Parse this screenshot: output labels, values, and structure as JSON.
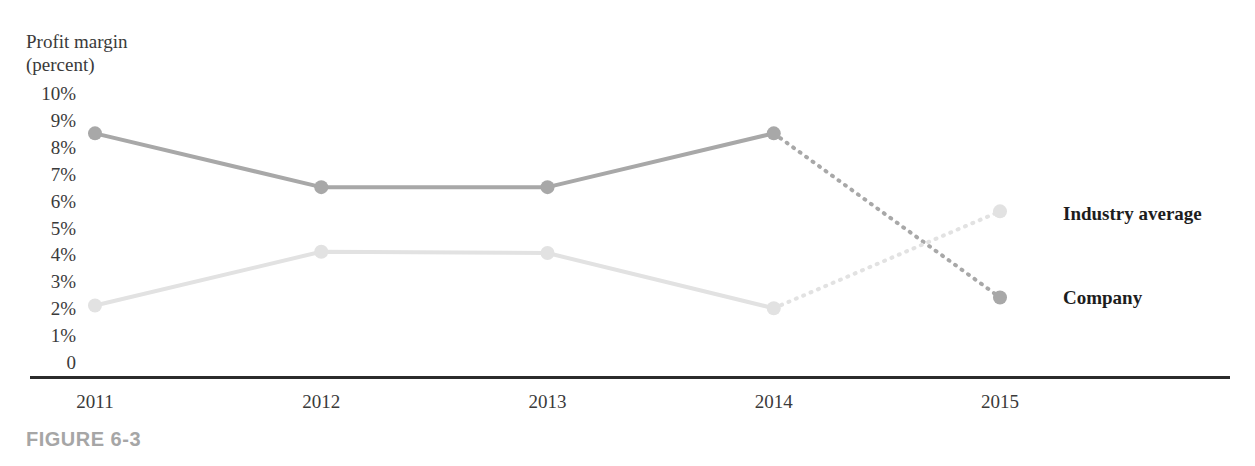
{
  "figure": {
    "caption": "FIGURE 6-3"
  },
  "axis": {
    "y_title_line1": "Profit margin",
    "y_title_line2": "(percent)",
    "y_ticks": [
      "10%",
      "9%",
      "8%",
      "7%",
      "6%",
      "5%",
      "4%",
      "3%",
      "2%",
      "1%",
      "0"
    ],
    "x_ticks": [
      "2011",
      "2012",
      "2013",
      "2014",
      "2015"
    ]
  },
  "legend": {
    "industry_label": "Industry average",
    "company_label": "Company"
  },
  "colors": {
    "industry_line": "#a8a8a8",
    "company_line": "#e2e2e2",
    "axis_rule": "#2b2b2b",
    "text": "#3a3a3a",
    "legend_text": "#1d1d1d",
    "caption_text": "#a6a6a6",
    "background": "#ffffff"
  },
  "chart_data": {
    "type": "line",
    "title": "",
    "xlabel": "",
    "ylabel": "Profit margin (percent)",
    "x": [
      "2011",
      "2012",
      "2013",
      "2014",
      "2015"
    ],
    "ylim": [
      0,
      10
    ],
    "ytick_values": [
      10,
      9,
      8,
      7,
      6,
      5,
      4,
      3,
      2,
      1,
      0
    ],
    "grid": false,
    "legend_position": "right",
    "series": [
      {
        "name": "Industry average",
        "values": [
          8.5,
          6.5,
          6.5,
          8.5,
          2.4
        ],
        "color": "#a8a8a8",
        "solid_through_index": 3,
        "dashed_from_index": 3,
        "marker": "circle"
      },
      {
        "name": "Company",
        "values": [
          2.1,
          4.1,
          4.05,
          2.0,
          5.6
        ],
        "color": "#e2e2e2",
        "solid_through_index": 3,
        "dashed_from_index": 3,
        "marker": "circle"
      }
    ],
    "annotations": [
      "Solid segments cover 2011-2014 (actuals); dotted segments cover 2014-2015 (projection).",
      "The two series cross between 2014 and 2015."
    ]
  }
}
